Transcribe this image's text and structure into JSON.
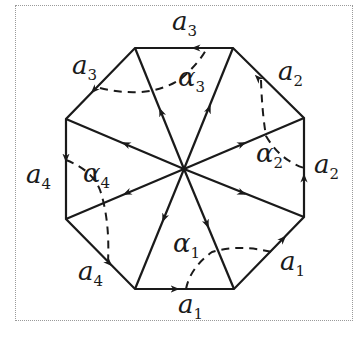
{
  "figure": {
    "colors": {
      "stroke": "#1a1a1a",
      "frame": "#9a9a9a",
      "background": "#ffffff"
    },
    "edge_labels": [
      {
        "base": "a",
        "sub": "3",
        "id": "top"
      },
      {
        "base": "a",
        "sub": "2",
        "id": "upper-right"
      },
      {
        "base": "a",
        "sub": "2",
        "id": "right"
      },
      {
        "base": "a",
        "sub": "1",
        "id": "lower-right"
      },
      {
        "base": "a",
        "sub": "1",
        "id": "bottom"
      },
      {
        "base": "a",
        "sub": "4",
        "id": "lower-left"
      },
      {
        "base": "a",
        "sub": "4",
        "id": "left"
      },
      {
        "base": "a",
        "sub": "3",
        "id": "upper-left"
      }
    ],
    "angle_labels": [
      {
        "base": "α",
        "sub": "3",
        "id": "alpha3"
      },
      {
        "base": "α",
        "sub": "2",
        "id": "alpha2"
      },
      {
        "base": "α",
        "sub": "1",
        "id": "alpha1"
      },
      {
        "base": "α",
        "sub": "4",
        "id": "alpha4"
      }
    ]
  }
}
